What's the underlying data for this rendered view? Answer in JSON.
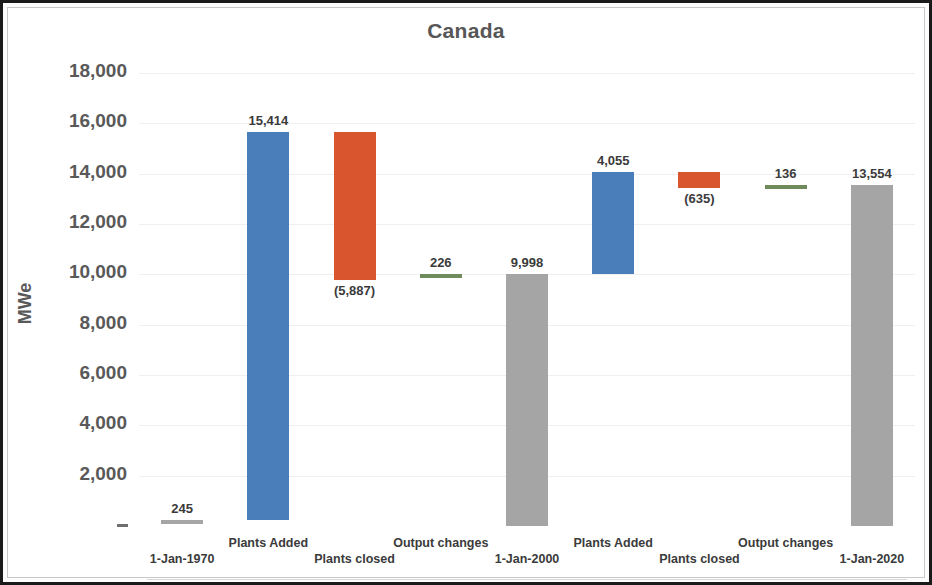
{
  "chart_data": {
    "type": "bar",
    "subtype": "waterfall",
    "title": "Canada",
    "xlabel": "",
    "ylabel": "MWe",
    "ylim": [
      0,
      18000
    ],
    "ytick_values": [
      18000,
      16000,
      14000,
      12000,
      10000,
      8000,
      6000,
      4000,
      2000,
      0
    ],
    "ytick_labels": [
      "18,000",
      "16,000",
      "14,000",
      "12,000",
      "10,000",
      "8,000",
      "6,000",
      "4,000",
      "2,000",
      "-"
    ],
    "grid": true,
    "legend": false,
    "categories": [
      "1-Jan-1970",
      "Plants Added",
      "Plants closed",
      "Output changes",
      "1-Jan-2000",
      "Plants Added",
      "Plants closed",
      "Output changes",
      "1-Jan-2020"
    ],
    "values": [
      245,
      15414,
      -5887,
      226,
      9998,
      4055,
      -635,
      136,
      13554
    ],
    "value_labels": [
      "245",
      "15,414",
      "(5,887)",
      "226",
      "9,998",
      "4,055",
      "(635)",
      "136",
      "13,554"
    ],
    "bar_kinds": [
      "total",
      "increase",
      "decrease",
      "increase",
      "total",
      "increase",
      "decrease",
      "increase",
      "total"
    ],
    "bar_bases": [
      0,
      245,
      9772,
      9772,
      0,
      9998,
      13418,
      13418,
      0
    ],
    "bar_tops": [
      245,
      15659,
      15659,
      9998,
      9998,
      14053,
      14053,
      13554,
      13554
    ],
    "label_positions": [
      "above",
      "above",
      "below",
      "above",
      "above",
      "above",
      "below",
      "above",
      "above"
    ],
    "colors": {
      "increase": "#4a7ebb",
      "decrease": "#d9552e",
      "total": "#a5a5a5",
      "small_increase": "#6f8b5c",
      "text": "#3b3b3b",
      "axis_text": "#595959",
      "gridline": "#efefef",
      "border": "#1a1a1a"
    }
  },
  "xaxis": {
    "rows": [
      {
        "row": 1,
        "labels": [
          "Plants Added",
          "Output changes",
          "Plants Added",
          "Output changes"
        ]
      },
      {
        "row": 0,
        "labels": [
          "1-Jan-1970",
          "Plants closed",
          "1-Jan-2000",
          "Plants closed",
          "1-Jan-2020"
        ]
      }
    ]
  }
}
